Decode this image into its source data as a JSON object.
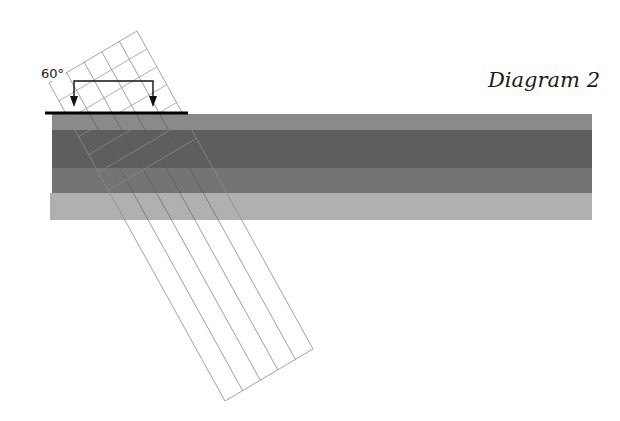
{
  "title": "Diagram 2",
  "angle_label": "60°",
  "colors": {
    "background": "#ffffff",
    "surface_line": "#000000",
    "grid_line": "#8c8c8c",
    "strip_line": "#555555",
    "arrow": "#111111"
  },
  "layers": [
    {
      "name": "layer-1",
      "color": "#8a8a8a",
      "y": 114,
      "height": 16,
      "x": 52,
      "width": 540
    },
    {
      "name": "layer-2",
      "color": "#5e5e5e",
      "y": 130,
      "height": 38,
      "x": 52,
      "width": 540
    },
    {
      "name": "layer-3",
      "color": "#747474",
      "y": 168,
      "height": 25,
      "x": 52,
      "width": 540
    },
    {
      "name": "layer-4",
      "color": "#b0b0b0",
      "y": 193,
      "height": 27,
      "x": 50,
      "width": 542
    }
  ],
  "surface_line": {
    "x1": 45,
    "x2": 188,
    "y": 113
  },
  "beam": {
    "corner_left": [
      49,
      83
    ],
    "corner_top": [
      137,
      31
    ],
    "corner_bottom_right": [
      313,
      349
    ],
    "corner_bottom_left": [
      225,
      401
    ],
    "columns": 5,
    "cross_lines": 6,
    "incidence_angle_deg": 60
  },
  "arrows": [
    {
      "name": "arrow-left",
      "x": 74,
      "y_top": 81,
      "y_tip": 107
    },
    {
      "name": "arrow-right",
      "x": 153,
      "y_top": 81,
      "y_tip": 107
    }
  ]
}
